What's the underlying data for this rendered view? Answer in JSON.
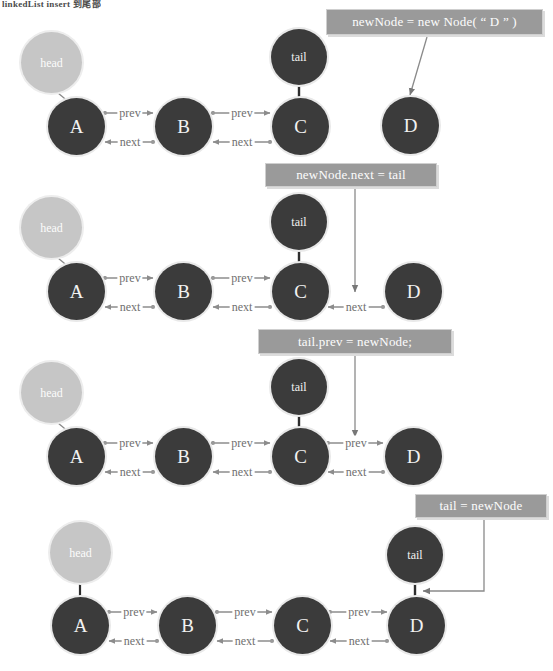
{
  "page": {
    "header_fragment": "linkedList insert 到尾部",
    "background": "#ffffff",
    "node_dark_color": "#3b3b3b",
    "node_light_color": "#c6c6c6",
    "code_box_color": "#9a9a9a",
    "edge_color": "#8c8c8c",
    "label_text_color": "#6f6f6f"
  },
  "legend": {
    "head_label": "head",
    "tail_label": "tail",
    "prev_label": "prev",
    "next_label": "next"
  },
  "steps": [
    {
      "id": "step-1",
      "code": "newNode = new Node( “ D ” )",
      "nodes": [
        {
          "name": "head",
          "label": "head",
          "kind": "pointer"
        },
        {
          "name": "a",
          "label": "A",
          "kind": "node"
        },
        {
          "name": "b",
          "label": "B",
          "kind": "node"
        },
        {
          "name": "c",
          "label": "C",
          "kind": "node"
        },
        {
          "name": "tail",
          "label": "tail",
          "kind": "pointer"
        },
        {
          "name": "d",
          "label": "D",
          "kind": "node"
        }
      ],
      "links": [
        {
          "from": "a",
          "to": "b",
          "label": "prev"
        },
        {
          "from": "b",
          "to": "a",
          "label": "next"
        },
        {
          "from": "b",
          "to": "c",
          "label": "prev"
        },
        {
          "from": "c",
          "to": "b",
          "label": "next"
        }
      ]
    },
    {
      "id": "step-2",
      "code": "newNode.next = tail",
      "nodes": [
        {
          "name": "head",
          "label": "head",
          "kind": "pointer"
        },
        {
          "name": "a",
          "label": "A",
          "kind": "node"
        },
        {
          "name": "b",
          "label": "B",
          "kind": "node"
        },
        {
          "name": "c",
          "label": "C",
          "kind": "node"
        },
        {
          "name": "tail",
          "label": "tail",
          "kind": "pointer"
        },
        {
          "name": "d",
          "label": "D",
          "kind": "node"
        }
      ],
      "links": [
        {
          "from": "a",
          "to": "b",
          "label": "prev"
        },
        {
          "from": "b",
          "to": "a",
          "label": "next"
        },
        {
          "from": "b",
          "to": "c",
          "label": "prev"
        },
        {
          "from": "c",
          "to": "b",
          "label": "next"
        },
        {
          "from": "d",
          "to": "c",
          "label": "next"
        }
      ]
    },
    {
      "id": "step-3",
      "code": "tail.prev = newNode;",
      "nodes": [
        {
          "name": "head",
          "label": "head",
          "kind": "pointer"
        },
        {
          "name": "a",
          "label": "A",
          "kind": "node"
        },
        {
          "name": "b",
          "label": "B",
          "kind": "node"
        },
        {
          "name": "c",
          "label": "C",
          "kind": "node"
        },
        {
          "name": "tail",
          "label": "tail",
          "kind": "pointer"
        },
        {
          "name": "d",
          "label": "D",
          "kind": "node"
        }
      ],
      "links": [
        {
          "from": "a",
          "to": "b",
          "label": "prev"
        },
        {
          "from": "b",
          "to": "a",
          "label": "next"
        },
        {
          "from": "b",
          "to": "c",
          "label": "prev"
        },
        {
          "from": "c",
          "to": "b",
          "label": "next"
        },
        {
          "from": "c",
          "to": "d",
          "label": "prev"
        },
        {
          "from": "d",
          "to": "c",
          "label": "next"
        }
      ]
    },
    {
      "id": "step-4",
      "code": "tail = newNode",
      "nodes": [
        {
          "name": "head",
          "label": "head",
          "kind": "pointer"
        },
        {
          "name": "a",
          "label": "A",
          "kind": "node"
        },
        {
          "name": "b",
          "label": "B",
          "kind": "node"
        },
        {
          "name": "c",
          "label": "C",
          "kind": "node"
        },
        {
          "name": "tail",
          "label": "tail",
          "kind": "pointer"
        },
        {
          "name": "d",
          "label": "D",
          "kind": "node"
        }
      ],
      "links": [
        {
          "from": "a",
          "to": "b",
          "label": "prev"
        },
        {
          "from": "b",
          "to": "a",
          "label": "next"
        },
        {
          "from": "b",
          "to": "c",
          "label": "prev"
        },
        {
          "from": "c",
          "to": "b",
          "label": "next"
        },
        {
          "from": "c",
          "to": "d",
          "label": "prev"
        },
        {
          "from": "d",
          "to": "c",
          "label": "next"
        }
      ]
    }
  ]
}
